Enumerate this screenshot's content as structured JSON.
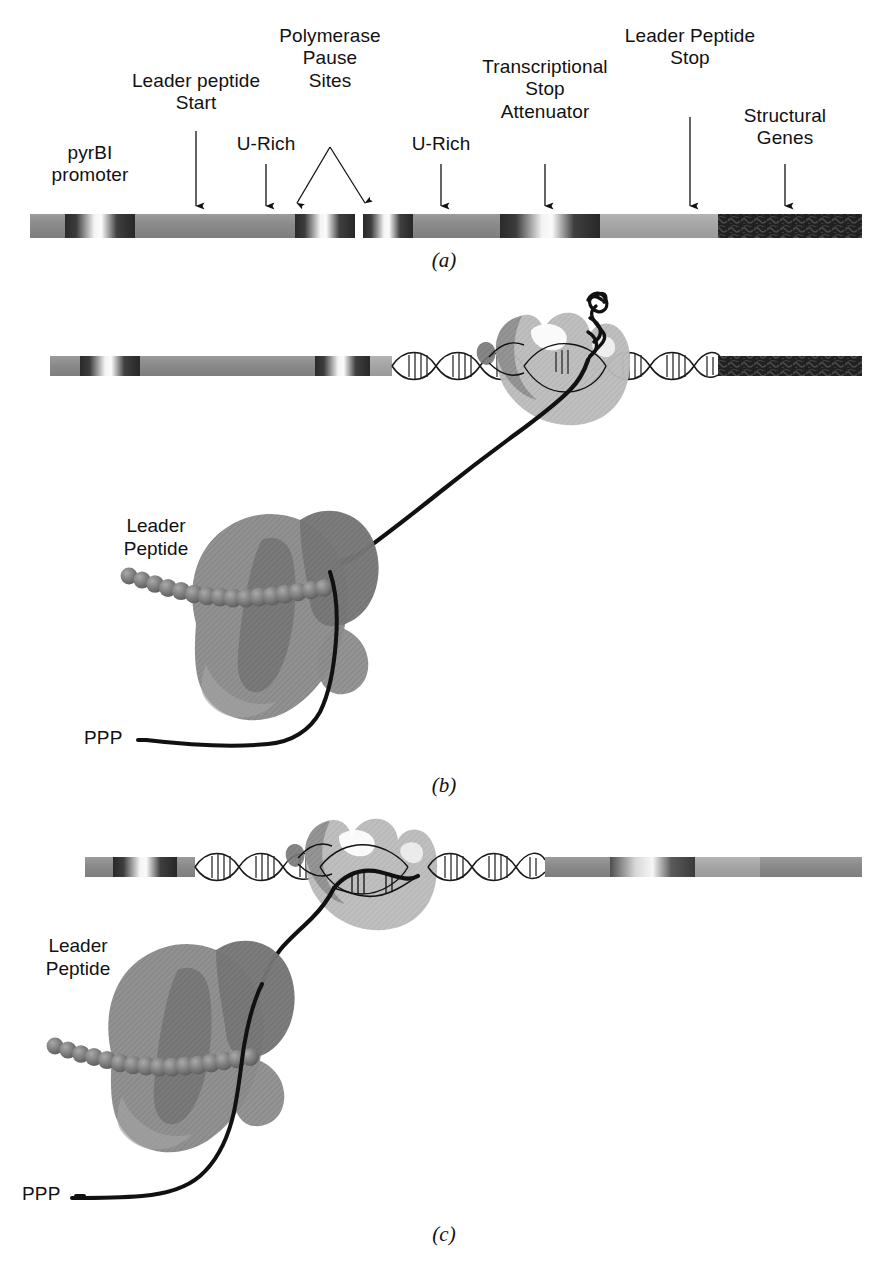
{
  "figure": {
    "kind": "three-panel biological schematic"
  },
  "panel_a": {
    "caption": "(a)",
    "labels": [
      {
        "name": "pyrbi-promoter",
        "text": "pyrBI\npromoter",
        "x": 90,
        "y": 152,
        "arrow": false
      },
      {
        "name": "leader-peptide-start",
        "text": "Leader peptide\nStart",
        "x": 196,
        "y": 78,
        "arrow": true,
        "arrow_x": 196,
        "arrow_y0": 130,
        "arrow_y1": 211
      },
      {
        "name": "u-rich-left",
        "text": "U-Rich",
        "x": 266,
        "y": 140,
        "arrow": true,
        "arrow_x": 266,
        "arrow_y0": 163,
        "arrow_y1": 211
      },
      {
        "name": "polymerase-pause-sites",
        "text": "Polymerase\nPause\nSites",
        "x": 330,
        "y": 32,
        "arrow": false
      },
      {
        "name": "u-rich-right",
        "text": "U-Rich",
        "x": 441,
        "y": 140,
        "arrow": true,
        "arrow_x": 441,
        "arrow_y0": 163,
        "arrow_y1": 211
      },
      {
        "name": "transcriptional-stop-attenuator",
        "text": "Transcriptional\nStop\nAttenuator",
        "x": 545,
        "y": 62,
        "arrow": true,
        "arrow_x": 545,
        "arrow_y0": 163,
        "arrow_y1": 211
      },
      {
        "name": "leader-peptide-stop",
        "text": "Leader Peptide\nStop",
        "x": 690,
        "y": 32,
        "arrow": true,
        "arrow_x": 690,
        "arrow_y0": 116,
        "arrow_y1": 211
      },
      {
        "name": "structural-genes",
        "text": "Structural\nGenes",
        "x": 785,
        "y": 112,
        "arrow": true,
        "arrow_x": 785,
        "arrow_y0": 163,
        "arrow_y1": 211
      }
    ],
    "pause_arrows": {
      "apex_x": 330,
      "apex_y": 146,
      "left_x": 302,
      "right_x": 362,
      "tip_y": 209
    },
    "bar": {
      "x": 30,
      "y": 214,
      "width": 832,
      "height": 24,
      "segments": [
        {
          "name": "upstream",
          "x0": 0,
          "x1": 35,
          "style": "mid-gray"
        },
        {
          "name": "pyrbi-promoter-band",
          "x0": 35,
          "x1": 105,
          "style": "band"
        },
        {
          "name": "leader-region",
          "x0": 105,
          "x1": 265,
          "style": "mid-gray"
        },
        {
          "name": "pause-site-1-band",
          "x0": 265,
          "x1": 325,
          "style": "band"
        },
        {
          "name": "pause-gap",
          "x0": 325,
          "x1": 333,
          "style": "white"
        },
        {
          "name": "pause-site-2-band",
          "x0": 333,
          "x1": 383,
          "style": "band"
        },
        {
          "name": "inter-region",
          "x0": 383,
          "x1": 470,
          "style": "mid-gray"
        },
        {
          "name": "attenuator-band",
          "x0": 470,
          "x1": 570,
          "style": "band"
        },
        {
          "name": "post-attenuator",
          "x0": 570,
          "x1": 688,
          "style": "light-gray"
        },
        {
          "name": "structural-genes-block",
          "x0": 688,
          "x1": 832,
          "style": "dark-textured"
        }
      ]
    }
  },
  "panel_b": {
    "caption": "(b)",
    "state_note": "Polymerase paused at pause site; ribosome translating leader peptide; 3' RNA hairpin formed",
    "labels": [
      {
        "name": "leader-peptide-label",
        "text": "Leader\nPeptide",
        "x": 155,
        "y": 525
      },
      {
        "name": "ppp-label",
        "text": "PPP",
        "x": 100,
        "y": 736
      }
    ],
    "left_bar": {
      "x": 50,
      "y": 356,
      "width": 342,
      "height": 20
    },
    "left_bar_segments": [
      {
        "name": "upstream",
        "x0": 0,
        "x1": 30,
        "style": "mid-gray"
      },
      {
        "name": "pyrbi-promoter-band",
        "x0": 30,
        "x1": 90,
        "style": "band"
      },
      {
        "name": "leader-region",
        "x0": 90,
        "x1": 265,
        "style": "mid-gray"
      },
      {
        "name": "pause-band",
        "x0": 265,
        "x1": 320,
        "style": "band"
      },
      {
        "name": "tail",
        "x0": 320,
        "x1": 342,
        "style": "light-gray"
      }
    ],
    "right_bar": {
      "x": 718,
      "y": 356,
      "width": 144,
      "height": 20,
      "style": "dark-textured"
    },
    "polymerase": {
      "cx": 570,
      "cy": 378,
      "name": "rna-polymerase"
    },
    "ribosome": {
      "cx": 300,
      "cy": 610,
      "name": "ribosome"
    },
    "hairpin": {
      "name": "rna-hairpin",
      "x": 600,
      "y": 300
    }
  },
  "panel_c": {
    "caption": "(c)",
    "state_note": "Polymerase advanced past attenuator; ribosome close behind; no terminator hairpin",
    "labels": [
      {
        "name": "leader-peptide-label",
        "text": "Leader\nPeptide",
        "x": 65,
        "y": 945
      },
      {
        "name": "ppp-label",
        "text": "PPP",
        "x": 40,
        "y": 1192
      }
    ],
    "left_bar": {
      "x": 85,
      "y": 857,
      "width": 110,
      "height": 20
    },
    "left_bar_segments": [
      {
        "name": "upstream",
        "x0": 0,
        "x1": 28,
        "style": "mid-gray"
      },
      {
        "name": "pyrbi-promoter-band",
        "x0": 28,
        "x1": 92,
        "style": "band"
      },
      {
        "name": "tail",
        "x0": 92,
        "x1": 110,
        "style": "mid-gray"
      }
    ],
    "right_bar": {
      "x": 545,
      "y": 857,
      "width": 317,
      "height": 20
    },
    "right_bar_segments": [
      {
        "name": "attenuator-downstream",
        "x0": 0,
        "x1": 65,
        "style": "mid-gray"
      },
      {
        "name": "band",
        "x0": 65,
        "x1": 150,
        "style": "band"
      },
      {
        "name": "light",
        "x0": 150,
        "x1": 215,
        "style": "light-gray"
      },
      {
        "name": "structural-genes-block",
        "x0": 215,
        "x1": 317,
        "style": "dark-textured"
      }
    ],
    "polymerase": {
      "cx": 375,
      "cy": 880,
      "name": "rna-polymerase"
    },
    "ribosome": {
      "cx": 215,
      "cy": 1040,
      "name": "ribosome"
    }
  },
  "colors": {
    "bar_mid_gray": "#8d8d8d",
    "bar_light_gray": "#a8a8a8",
    "bar_dark": "#2b2b2b",
    "band_dark": "#1f1f1f",
    "band_light": "#f2f2f2",
    "polymerase_fill": "#b9b9b9",
    "polymerase_shade": "#9a9a9a",
    "ribosome_fill": "#8e8e8e",
    "ribosome_shade": "#6f6f6f",
    "rna_stroke": "#111111",
    "dna_stroke": "#1a1a1a",
    "text": "#111111"
  },
  "footnote": {
    "text": ""
  }
}
